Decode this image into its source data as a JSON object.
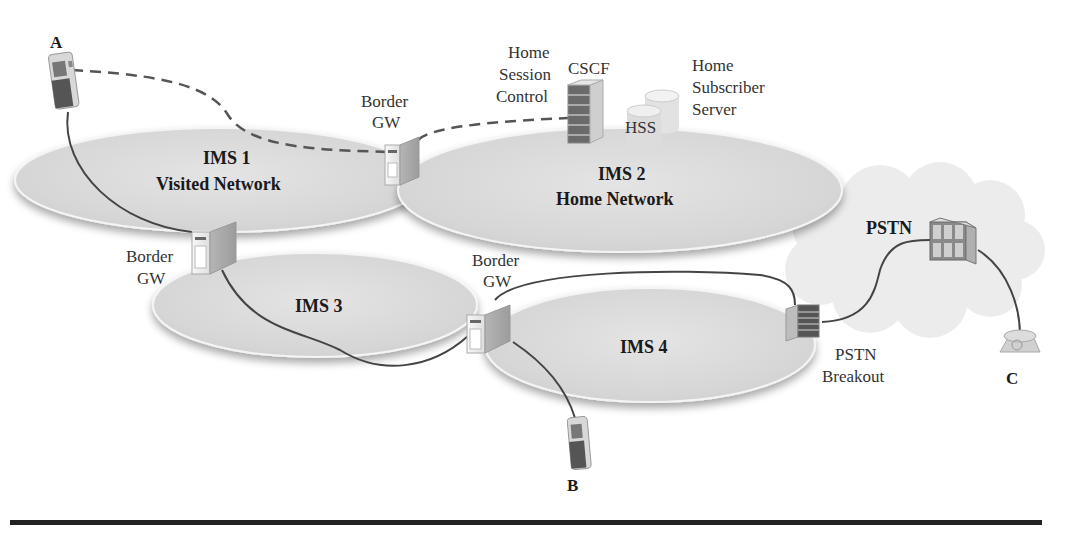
{
  "diagram": {
    "networks": [
      {
        "id": "ims1",
        "name": "IMS 1",
        "subtitle": "Visited Network"
      },
      {
        "id": "ims2",
        "name": "IMS 2",
        "subtitle": "Home Network"
      },
      {
        "id": "ims3",
        "name": "IMS 3",
        "subtitle": ""
      },
      {
        "id": "ims4",
        "name": "IMS 4",
        "subtitle": ""
      },
      {
        "id": "pstn",
        "name": "PSTN",
        "subtitle": ""
      }
    ],
    "endpoints": {
      "a": "A",
      "b": "B",
      "c": "C"
    },
    "border_gw": {
      "line1": "Border",
      "line2": "GW"
    },
    "cscf": {
      "title": "CSCF",
      "desc_line1": "Home",
      "desc_line2": "Session",
      "desc_line3": "Control"
    },
    "hss": {
      "title": "HSS",
      "desc_line1": "Home",
      "desc_line2": "Subscriber",
      "desc_line3": "Server"
    },
    "pstn_breakout": {
      "line1": "PSTN",
      "line2": "Breakout"
    },
    "colors": {
      "ellipse_fill": "#dcdcdc",
      "line": "#444444",
      "dashed_line": "#555555",
      "rule": "#222222"
    }
  }
}
